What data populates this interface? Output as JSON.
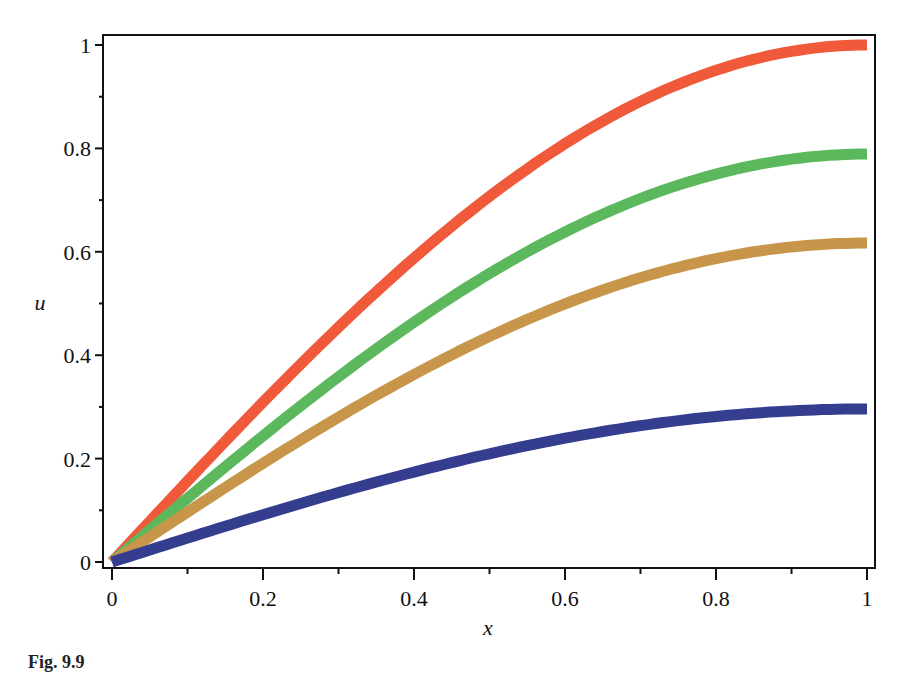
{
  "caption": "Fig. 9.9",
  "chart_data": {
    "type": "line",
    "title": "",
    "xlabel": "x",
    "ylabel": "u",
    "xlim": [
      0,
      1
    ],
    "ylim": [
      0,
      1
    ],
    "grid": false,
    "legend": null,
    "x_ticks": [
      "0",
      "0.2",
      "0.4",
      "0.6",
      "0.8",
      "1"
    ],
    "y_ticks": [
      "0",
      "0.2",
      "0.4",
      "0.6",
      "0.8",
      "1"
    ],
    "x": [
      0,
      0.1,
      0.2,
      0.3,
      0.4,
      0.5,
      0.6,
      0.7,
      0.8,
      0.9,
      1.0
    ],
    "series": [
      {
        "name": "curve-red",
        "color": "#f05a3a",
        "amplitude": 1.0,
        "values": [
          0,
          0.156,
          0.309,
          0.454,
          0.588,
          0.707,
          0.809,
          0.891,
          0.951,
          0.988,
          1.0
        ]
      },
      {
        "name": "curve-green",
        "color": "#5cb85c",
        "amplitude": 0.789,
        "values": [
          0,
          0.123,
          0.244,
          0.358,
          0.464,
          0.558,
          0.638,
          0.703,
          0.75,
          0.779,
          0.789
        ]
      },
      {
        "name": "curve-tan",
        "color": "#c8964a",
        "amplitude": 0.617,
        "values": [
          0,
          0.097,
          0.191,
          0.28,
          0.363,
          0.436,
          0.499,
          0.55,
          0.587,
          0.609,
          0.617
        ]
      },
      {
        "name": "curve-blue",
        "color": "#353d8e",
        "amplitude": 0.296,
        "values": [
          0,
          0.046,
          0.091,
          0.134,
          0.174,
          0.209,
          0.239,
          0.264,
          0.282,
          0.292,
          0.296
        ]
      }
    ]
  }
}
